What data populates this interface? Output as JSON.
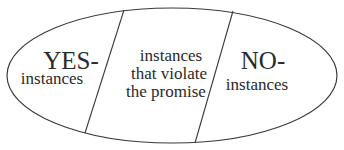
{
  "diagram": {
    "regions": [
      {
        "id": "yes",
        "title": "YES-",
        "lines": [
          "instances"
        ]
      },
      {
        "id": "violate",
        "title": "",
        "lines": [
          "instances",
          "that violate",
          "the promise"
        ]
      },
      {
        "id": "no",
        "title": "NO-",
        "lines": [
          "instances"
        ]
      }
    ],
    "colors": {
      "stroke": "#3a3a3a",
      "text": "#2a2a2a",
      "background": "#ffffff"
    }
  }
}
